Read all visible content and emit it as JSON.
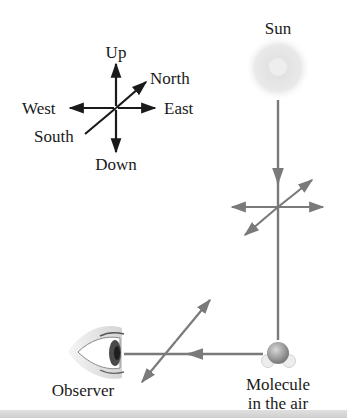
{
  "compass": {
    "up": "Up",
    "down": "Down",
    "east": "East",
    "west": "West",
    "north": "North",
    "south": "South"
  },
  "sun": {
    "label": "Sun"
  },
  "molecule": {
    "label_line1": "Molecule",
    "label_line2": "in the air"
  },
  "observer": {
    "label": "Observer"
  },
  "colors": {
    "compass_axes": "#1a1a1a",
    "light_ray": "#7a7a7a",
    "sun": "#e6e6e6",
    "molecule": "#9a9a9a",
    "bottom_bar": "#d4d4d4"
  }
}
